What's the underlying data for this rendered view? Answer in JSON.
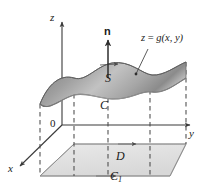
{
  "figure": {
    "kind": "3d-surface-diagram",
    "background_color": "#ffffff",
    "line_color": "#3a3a3a",
    "dash_color": "#4a4a4a",
    "surface_fill_light": "#d9d9d9",
    "surface_fill_dark": "#8f8f8f",
    "region_fill": "#e2e2e2"
  },
  "axes": {
    "z_label": "z",
    "y_label": "y",
    "x_label": "x",
    "origin_label": "0"
  },
  "labels": {
    "normal_vector": "n",
    "surface": "S",
    "boundary_curve": "C",
    "projected_curve": "C",
    "projected_curve_subscript": "1",
    "region": "D",
    "surface_equation_lhs": "z",
    "surface_equation_op": " = ",
    "surface_equation_rhs": "g(x, y)"
  }
}
